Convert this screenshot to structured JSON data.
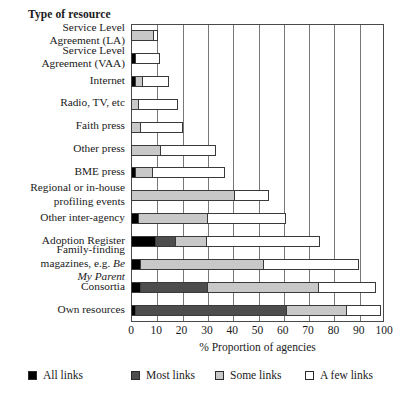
{
  "chart_data": {
    "type": "bar",
    "orientation": "horizontal",
    "stacked": true,
    "title": "",
    "ylabel": "Type of resource",
    "xlabel": "% Proportion of agencies",
    "xlim": [
      0,
      100
    ],
    "grid": true,
    "legend_position": "bottom",
    "xticks": [
      "0",
      "10",
      "20",
      "30",
      "40",
      "50",
      "60",
      "70",
      "80",
      "90",
      "100"
    ],
    "xtick_values": [
      0,
      10,
      20,
      30,
      40,
      50,
      60,
      70,
      80,
      90,
      100
    ],
    "categories": [
      "Service Level Agreement (LA)",
      "Service Level Agreement (VAA)",
      "Internet",
      "Radio, TV, etc",
      "Faith press",
      "Other press",
      "BME press",
      "Regional or in-house profiling events",
      "Other inter-agency",
      "Adoption Register",
      "Family-finding magazines, e.g. Be My Parent",
      "Consortia",
      "Own resources"
    ],
    "series": [
      {
        "name": "All links",
        "color": "#000000",
        "values": [
          0,
          2,
          2,
          0,
          0,
          0,
          2,
          0,
          3,
          10,
          4,
          4,
          2
        ]
      },
      {
        "name": "Most links",
        "color": "#4d4d4d",
        "values": [
          0,
          0,
          0,
          0,
          0,
          0,
          0,
          0,
          0,
          8,
          0,
          27,
          60
        ]
      },
      {
        "name": "Some links",
        "color": "#c8c8c8",
        "values": [
          9,
          0,
          3,
          3,
          4,
          12,
          7,
          41,
          28,
          13,
          49,
          44,
          24
        ]
      },
      {
        "name": "A few links",
        "color": "#ffffff",
        "values": [
          2,
          10,
          11,
          16,
          17,
          22,
          29,
          14,
          31,
          45,
          38,
          23,
          14
        ]
      }
    ]
  },
  "labels": {
    "rows": [
      {
        "lines": [
          {
            "text": "Service Level",
            "italic": false
          },
          {
            "text": "Agreement (LA)",
            "italic": false
          }
        ]
      },
      {
        "lines": [
          {
            "text": "Service Level",
            "italic": false
          },
          {
            "text": "Agreement (VAA)",
            "italic": false
          }
        ]
      },
      {
        "lines": [
          {
            "text": "Internet",
            "italic": false
          }
        ]
      },
      {
        "lines": [
          {
            "text": "Radio, TV, etc",
            "italic": false
          }
        ]
      },
      {
        "lines": [
          {
            "text": "Faith press",
            "italic": false
          }
        ]
      },
      {
        "lines": [
          {
            "text": "Other press",
            "italic": false
          }
        ]
      },
      {
        "lines": [
          {
            "text": "BME press",
            "italic": false
          }
        ]
      },
      {
        "lines": [
          {
            "text": "Regional or in-house",
            "italic": false
          },
          {
            "text": "profiling events",
            "italic": false
          }
        ]
      },
      {
        "lines": [
          {
            "text": "Other inter-agency",
            "italic": false
          }
        ]
      },
      {
        "lines": [
          {
            "text": "Adoption Register",
            "italic": false
          }
        ]
      },
      {
        "lines": [
          {
            "text": "Family-finding",
            "italic": false
          },
          {
            "text": "magazines, e.g. ",
            "italic": false,
            "tail": "Be",
            "tail_italic": true
          },
          {
            "text": "My Parent",
            "italic": true
          }
        ]
      },
      {
        "lines": [
          {
            "text": "Consortia",
            "italic": false
          }
        ]
      },
      {
        "lines": [
          {
            "text": "Own resources",
            "italic": false
          }
        ]
      }
    ]
  }
}
